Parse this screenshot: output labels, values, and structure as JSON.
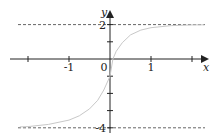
{
  "chart_data": {
    "type": "line",
    "title": "",
    "xlabel": "x",
    "ylabel": "y",
    "xlim": [
      -2.2,
      2.4
    ],
    "ylim": [
      -4.2,
      2.9
    ],
    "grid": false,
    "x_ticks": [
      -2,
      -1,
      0,
      1,
      2
    ],
    "x_tick_labels": [
      {
        "value": -1,
        "label": "-1"
      },
      {
        "value": 1,
        "label": "1"
      }
    ],
    "y_ticks": [
      -4,
      -3,
      -2,
      -1,
      1,
      2
    ],
    "y_tick_labels": [
      {
        "value": 2,
        "label": "2"
      },
      {
        "value": -4,
        "label": "-4"
      }
    ],
    "origin_label": "0",
    "asymptotes": [
      {
        "type": "horizontal",
        "y": 2,
        "style": "dashed"
      },
      {
        "type": "horizontal",
        "y": -4,
        "style": "dashed"
      }
    ],
    "series": [
      {
        "name": "curve",
        "color": "#c8c8c8",
        "description": "Increasing sigmoid from y=-4 (left asymptote) to y=2 (right asymptote), y-intercept ≈ -1",
        "x": [
          -2.2,
          -2.0,
          -1.5,
          -1.0,
          -0.75,
          -0.5,
          -0.3,
          -0.15,
          0.0,
          0.07,
          0.15,
          0.3,
          0.5,
          0.75,
          1.0,
          1.5,
          2.0,
          2.3
        ],
        "y": [
          -3.95,
          -3.93,
          -3.8,
          -3.55,
          -3.3,
          -2.9,
          -2.4,
          -1.8,
          -1.0,
          0.0,
          0.45,
          0.95,
          1.4,
          1.68,
          1.82,
          1.94,
          1.98,
          1.99
        ]
      }
    ],
    "colors": {
      "axis": "#222222",
      "dashed": "#666666",
      "curve": "#c8c8c8"
    }
  }
}
